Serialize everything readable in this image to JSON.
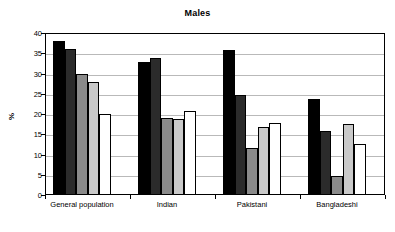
{
  "chart_data": {
    "type": "bar",
    "title": "Males",
    "xlabel": "",
    "ylabel": "%",
    "ylim": [
      0,
      40
    ],
    "yticks": [
      0,
      5,
      10,
      15,
      20,
      25,
      30,
      35,
      40
    ],
    "grid": true,
    "legend": "none",
    "categories": [
      "General population",
      "Indian",
      "Pakistani",
      "Bangladeshi"
    ],
    "series": [
      {
        "name": "series-1",
        "color": "#000000",
        "values": [
          38.0,
          32.9,
          35.8,
          23.7
        ]
      },
      {
        "name": "series-2",
        "color": "#2b2b2b",
        "values": [
          36.0,
          33.8,
          24.8,
          15.7
        ]
      },
      {
        "name": "series-3",
        "color": "#8a8a8a",
        "values": [
          29.9,
          18.9,
          11.7,
          4.6
        ]
      },
      {
        "name": "series-4",
        "color": "#c9c9c9",
        "values": [
          27.8,
          18.8,
          16.7,
          17.6
        ]
      },
      {
        "name": "series-5",
        "color": "#ffffff",
        "values": [
          19.9,
          20.7,
          17.7,
          12.6
        ]
      }
    ]
  },
  "colors": {
    "axis": "#000000",
    "gridline": "#b9b9b9",
    "background": "#ffffff"
  }
}
